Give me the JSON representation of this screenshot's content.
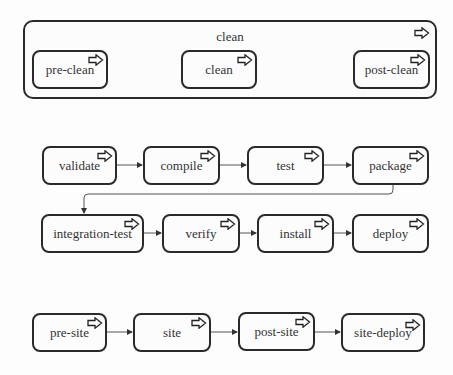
{
  "lifecycles": [
    {
      "name": "clean",
      "phases": [
        "pre-clean",
        "clean",
        "post-clean"
      ]
    },
    {
      "name": "default",
      "phases": [
        "validate",
        "compile",
        "test",
        "package",
        "integration-test",
        "verify",
        "install",
        "deploy"
      ]
    },
    {
      "name": "site",
      "phases": [
        "pre-site",
        "site",
        "post-site",
        "site-deploy"
      ]
    }
  ],
  "icon": "block-arrow-right-icon",
  "colors": {
    "border": "#2a2a2a",
    "background": "#fcfcfc",
    "text": "#333333"
  }
}
